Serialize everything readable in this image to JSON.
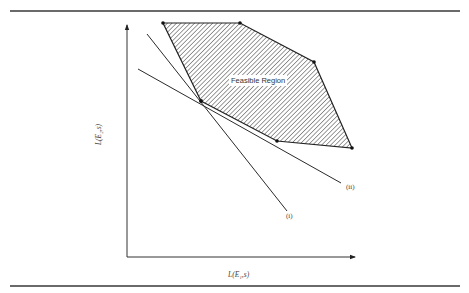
{
  "figure": {
    "region_label": "Feasible Region",
    "x_axis_label": "L(E₁,s)",
    "y_axis_label": "L(E₂,s)",
    "lines": [
      {
        "id": "i",
        "label": "(i)"
      },
      {
        "id": "ii",
        "label": "(ii)"
      }
    ],
    "feasible_region_vertices": [
      [
        163,
        23
      ],
      [
        240,
        23
      ],
      [
        314,
        62
      ],
      [
        352,
        148
      ],
      [
        277,
        141
      ],
      [
        201,
        101
      ]
    ],
    "line_i": {
      "from": [
        147,
        34
      ],
      "to": [
        287,
        211
      ]
    },
    "line_ii": {
      "from": [
        138,
        69
      ],
      "to": [
        341,
        183
      ]
    },
    "hatch_color": "#555555",
    "line_color": "#2a2a2a"
  }
}
